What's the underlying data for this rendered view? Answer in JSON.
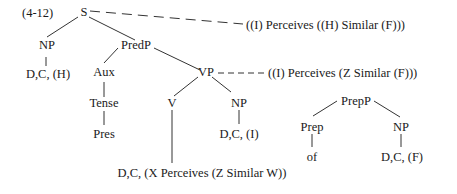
{
  "diagram": {
    "example_number": "(4-12)",
    "type": "syntax-tree",
    "nodes": {
      "S": "S",
      "NP_subj": "NP",
      "D_subj": "D,C, (H)",
      "PredP": "PredP",
      "Aux": "Aux",
      "Tense": "Tense",
      "Pres": "Pres",
      "VP": "VP",
      "V": "V",
      "NP_obj": "NP",
      "D_obj": "D,C, (I)",
      "V_gloss": "D,C, (X Perceives (Z Similar W))",
      "PrepP": "PrepP",
      "Prep": "Prep",
      "of": "of",
      "NP_prep": "NP",
      "D_prep": "D,C, (F)"
    },
    "annotations": {
      "S_reading": "((I) Perceives ((H) Similar (F)))",
      "VP_reading": "((I) Perceives (Z Similar (F)))"
    },
    "edges": [
      [
        "S",
        "NP_subj"
      ],
      [
        "S",
        "PredP"
      ],
      [
        "NP_subj",
        "D_subj"
      ],
      [
        "PredP",
        "Aux"
      ],
      [
        "PredP",
        "VP"
      ],
      [
        "Aux",
        "Tense"
      ],
      [
        "Tense",
        "Pres"
      ],
      [
        "VP",
        "V"
      ],
      [
        "VP",
        "NP_obj"
      ],
      [
        "NP_obj",
        "D_obj"
      ],
      [
        "V",
        "V_gloss"
      ],
      [
        "PrepP",
        "Prep"
      ],
      [
        "PrepP",
        "NP_prep"
      ],
      [
        "Prep",
        "of"
      ],
      [
        "NP_prep",
        "D_prep"
      ]
    ],
    "line_color": "#333333"
  }
}
